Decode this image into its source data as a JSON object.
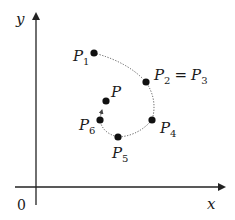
{
  "axes": {
    "x_label": "x",
    "y_label": "y",
    "origin_label": "0",
    "color": "#222222"
  },
  "curve": {
    "style": "dotted",
    "color": "#555555",
    "order": [
      "P1",
      "P2",
      "P3",
      "P4",
      "P5",
      "P6",
      "P"
    ]
  },
  "points": [
    {
      "id": "P1",
      "base": "P",
      "sub": "1",
      "x": 94,
      "y": 53
    },
    {
      "id": "P2",
      "base": "P",
      "sub": "2",
      "x": 146,
      "y": 82
    },
    {
      "id": "P4",
      "base": "P",
      "sub": "4",
      "x": 152,
      "y": 120
    },
    {
      "id": "P5",
      "base": "P",
      "sub": "5",
      "x": 118,
      "y": 137
    },
    {
      "id": "P6",
      "base": "P",
      "sub": "6",
      "x": 100,
      "y": 120
    },
    {
      "id": "P",
      "base": "P",
      "sub": "",
      "x": 106,
      "y": 101
    }
  ],
  "labels": {
    "p1": {
      "base": "P",
      "sub": "1"
    },
    "p2": {
      "base": "P",
      "sub": "2"
    },
    "eq": "=",
    "p3": {
      "base": "P",
      "sub": "3"
    },
    "p4": {
      "base": "P",
      "sub": "4"
    },
    "p5": {
      "base": "P",
      "sub": "5"
    },
    "p6": {
      "base": "P",
      "sub": "6"
    },
    "p": {
      "base": "P"
    }
  },
  "point_color": "#111111"
}
